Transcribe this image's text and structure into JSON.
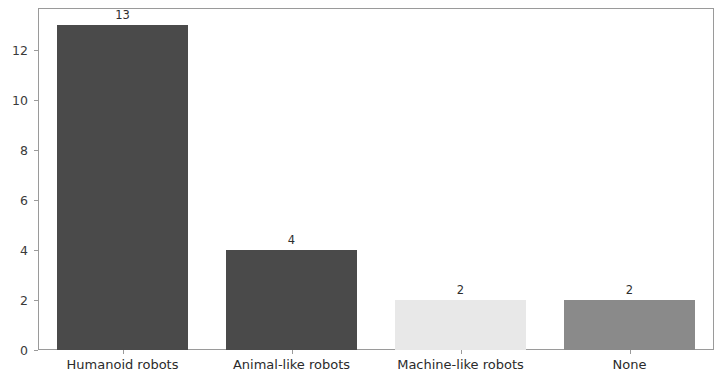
{
  "chart_data": {
    "type": "bar",
    "title": "",
    "subtitle": "",
    "xlabel": "",
    "ylabel": "",
    "categories": [
      "Humanoid robots",
      "Animal-like robots",
      "Machine-like robots",
      "None"
    ],
    "values": [
      13,
      4,
      2,
      2
    ],
    "value_labels": [
      "13",
      "4",
      "2",
      "2"
    ],
    "bar_colors": [
      "#4a4a4a",
      "#4a4a4a",
      "#e8e8e8",
      "#8a8a8a"
    ],
    "ylim": [
      0,
      13.7
    ],
    "xlim": [
      0,
      4
    ],
    "yticks": [
      0,
      2,
      4,
      6,
      8,
      10,
      12
    ],
    "ytick_labels": [
      "0",
      "2",
      "4",
      "6",
      "8",
      "10",
      "12"
    ],
    "xtick_labels": [
      "Humanoid robots",
      "Animal-like robots",
      "Machine-like robots",
      "None"
    ],
    "grid": false,
    "legend": null,
    "annotations": [],
    "axis_color": "#9a9a9a",
    "background_color": "#ffffff",
    "bar_width_fraction": 0.78
  }
}
